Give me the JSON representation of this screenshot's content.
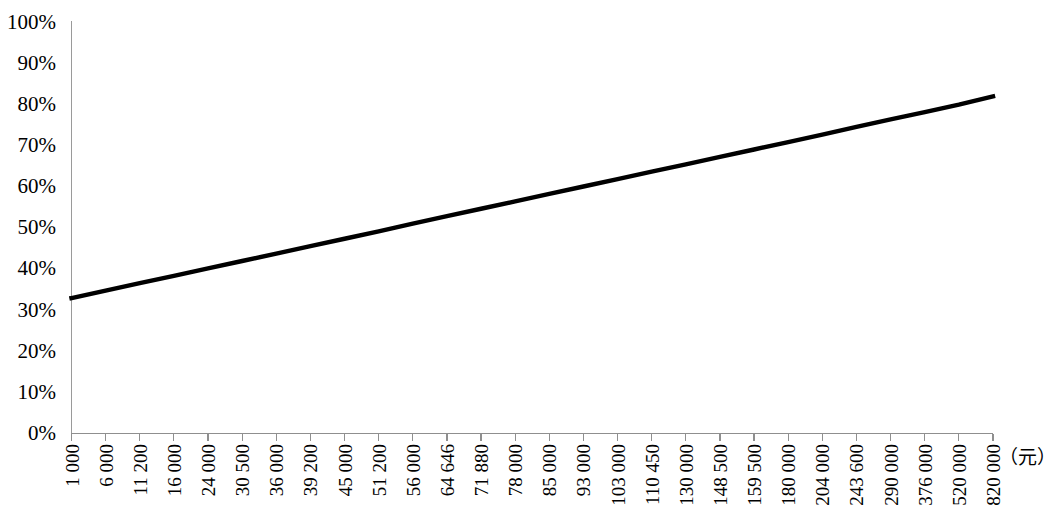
{
  "chart_data": {
    "type": "line",
    "title": "",
    "subtitle": "",
    "xlabel": "（元）",
    "ylabel": "",
    "grid": false,
    "legend": false,
    "legend_position": "none",
    "line_color": "#000000",
    "axis_color": "#8f8f8f",
    "background_color": "#ffffff",
    "ylim": [
      0,
      100
    ],
    "ytick_labels": [
      "100%",
      "90%",
      "80%",
      "70%",
      "60%",
      "50%",
      "40%",
      "30%",
      "20%",
      "10%",
      "0%"
    ],
    "ytick_values": [
      100,
      90,
      80,
      70,
      60,
      50,
      40,
      30,
      20,
      10,
      0
    ],
    "categories": [
      "1 000",
      "6 000",
      "11 200",
      "16 000",
      "24 000",
      "30 500",
      "36 000",
      "39 200",
      "45 000",
      "51 200",
      "56 000",
      "64 646",
      "71 880",
      "78 000",
      "85 000",
      "93 000",
      "103 000",
      "110 450",
      "130 000",
      "148 500",
      "159 500",
      "180 000",
      "204 000",
      "243 600",
      "290 000",
      "376 000",
      "520 000",
      "820 000"
    ],
    "series": [
      {
        "name": "",
        "values": [
          32.8,
          34.6,
          36.4,
          38.2,
          40.0,
          41.8,
          43.6,
          45.4,
          47.2,
          49.0,
          50.9,
          52.7,
          54.5,
          56.3,
          58.1,
          59.9,
          61.7,
          63.5,
          65.3,
          67.1,
          68.9,
          70.7,
          72.5,
          74.4,
          76.2,
          78.0,
          79.8,
          81.8
        ]
      }
    ]
  }
}
